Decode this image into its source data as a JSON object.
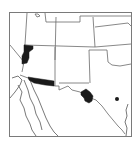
{
  "map": {
    "type": "species-distribution-map",
    "region": "Southwestern United States and northern Mexico",
    "colors": {
      "background": "#ffffff",
      "borders": "#6a6a6a",
      "range_fill": "#1a1a1a"
    },
    "range_areas": [
      {
        "name": "western-arizona-range",
        "fill": "#1a1a1a"
      },
      {
        "name": "southern-arizona-range",
        "fill": "#1a1a1a"
      },
      {
        "name": "west-texas-range",
        "fill": "#1a1a1a"
      }
    ],
    "point_records": [
      {
        "name": "central-texas-record",
        "x": 117,
        "y": 99
      }
    ]
  }
}
